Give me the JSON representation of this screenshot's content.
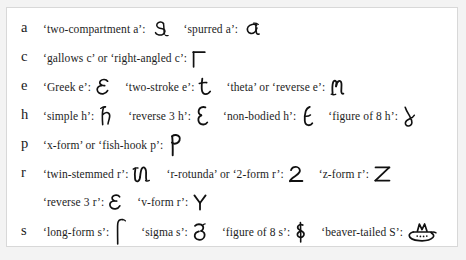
{
  "figure": {
    "background_color": "#f3f3f3",
    "panel_color": "#ffffff",
    "border_color": "#d8d8d8",
    "ink_color": "#111111"
  },
  "rows": [
    {
      "letter": "a",
      "entries": [
        {
          "label": "‘two-compartment a’:",
          "glyph": "two-compartment-a"
        },
        {
          "label": "‘spurred a’:",
          "glyph": "spurred-a"
        }
      ]
    },
    {
      "letter": "c",
      "entries": [
        {
          "label": "‘gallows c’ or ‘right-angled c’:",
          "glyph": "gallows-c"
        }
      ]
    },
    {
      "letter": "e",
      "entries": [
        {
          "label": "‘Greek e’:",
          "glyph": "greek-e"
        },
        {
          "label": "‘two-stroke e’:",
          "glyph": "two-stroke-e"
        },
        {
          "label": "‘theta’ or ‘reverse e’:",
          "glyph": "theta-reverse-e"
        }
      ]
    },
    {
      "letter": "h",
      "entries": [
        {
          "label": "‘simple h’:",
          "glyph": "simple-h"
        },
        {
          "label": "‘reverse 3 h’:",
          "glyph": "reverse-3-h"
        },
        {
          "label": "‘non-bodied h’:",
          "glyph": "non-bodied-h"
        },
        {
          "label": "‘figure of 8 h’:",
          "glyph": "figure-of-8-h"
        }
      ]
    },
    {
      "letter": "p",
      "entries": [
        {
          "label": "‘x-form’ or ‘fish-hook p’:",
          "glyph": "fish-hook-p"
        }
      ]
    },
    {
      "letter": "r",
      "entries": [
        {
          "label": "‘twin-stemmed r’:",
          "glyph": "twin-stemmed-r"
        },
        {
          "label": "‘r-rotunda’ or ‘2-form r’:",
          "glyph": "r-rotunda"
        },
        {
          "label": "‘z-form r’:",
          "glyph": "z-form-r"
        }
      ],
      "continuation": [
        {
          "label": "‘reverse 3 r’:",
          "glyph": "reverse-3-r"
        },
        {
          "label": "‘v-form r’:",
          "glyph": "v-form-r"
        }
      ]
    },
    {
      "letter": "s",
      "entries": [
        {
          "label": "‘long-form s’:",
          "glyph": "long-form-s"
        },
        {
          "label": "‘sigma s’:",
          "glyph": "sigma-s"
        },
        {
          "label": "‘figure of 8 s’:",
          "glyph": "figure-of-8-s"
        },
        {
          "label": "‘beaver-tailed S’:",
          "glyph": "beaver-tailed-s"
        }
      ]
    }
  ]
}
